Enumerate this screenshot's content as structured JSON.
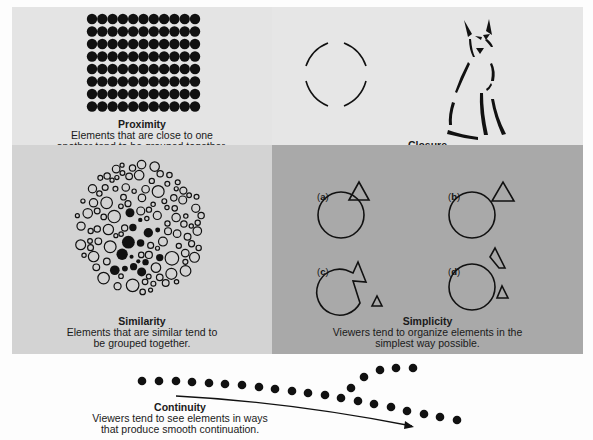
{
  "proximity": {
    "title": "Proximity",
    "line1": "Elements that are close to one",
    "line2": "another tend to be grouped together.",
    "grid": {
      "rows": 8,
      "cols": 11
    }
  },
  "closure": {
    "title": "Closure",
    "line1": "Viewers tend to supply missing elements to",
    "line2": "close or complete a familiar figure."
  },
  "similarity": {
    "title": "Similarity",
    "line1": "Elements that are similar tend to",
    "line2": "be grouped together."
  },
  "simplicity": {
    "title": "Simplicity",
    "line1": "Viewers tend to organize elements in the",
    "line2": "simplest way possible.",
    "labels": [
      "a",
      "b",
      "c",
      "d"
    ]
  },
  "continuity": {
    "title": "Continuity",
    "line1": "Viewers tend to see elements in ways",
    "line2": "that produce smooth continuation."
  },
  "colors": {
    "proximity_bg": "#e4e4e4",
    "closure_bg": "#e6e6e6",
    "similarity_bg": "#d3d3d3",
    "simplicity_bg": "#a9a9a9",
    "ink": "#111111"
  }
}
